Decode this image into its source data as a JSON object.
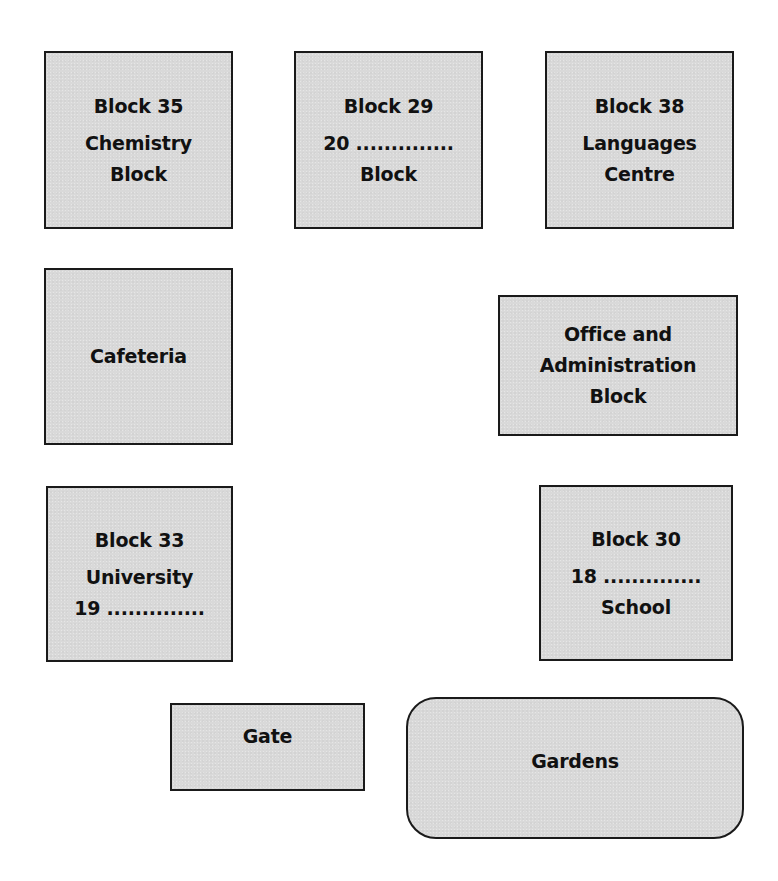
{
  "diagram": {
    "type": "campus-map",
    "fill_color": "#d9d9d9",
    "border_color": "#1a1a1a",
    "text_color": "#111111"
  },
  "buildings": {
    "block35": {
      "number": "Block 35",
      "name_line1": "Chemistry",
      "name_line2": "Block"
    },
    "block29": {
      "number": "Block 29",
      "name_line1": "20 ..............",
      "name_line2": "Block",
      "question_number": "20"
    },
    "block38": {
      "number": "Block 38",
      "name_line1": "Languages",
      "name_line2": "Centre"
    },
    "cafeteria": {
      "name": "Cafeteria"
    },
    "office": {
      "name_line1": "Office and",
      "name_line2": "Administration",
      "name_line3": "Block"
    },
    "block33": {
      "number": "Block 33",
      "name_line1": "University",
      "name_line2": "19 ..............",
      "question_number": "19"
    },
    "block30": {
      "number": "Block 30",
      "name_line1": "18 ..............",
      "name_line2": "School",
      "question_number": "18"
    },
    "gate": {
      "name": "Gate"
    },
    "gardens": {
      "name": "Gardens",
      "shape": "rounded-rectangle"
    }
  }
}
